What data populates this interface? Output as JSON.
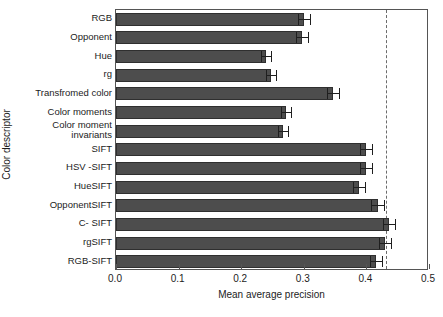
{
  "chart_data": {
    "type": "bar",
    "orientation": "horizontal",
    "title": "",
    "xlabel": "Mean average precision",
    "ylabel": "Color descriptor",
    "xlim": [
      0.0,
      0.5
    ],
    "xticks": [
      "0.0",
      "0.1",
      "0.2",
      "0.3",
      "0.4",
      "0.5"
    ],
    "xtick_values": [
      0.0,
      0.1,
      0.2,
      0.3,
      0.4,
      0.5
    ],
    "grid": false,
    "legend": "none",
    "bar_color": "#4d4d4d",
    "bar_edge_color": "#2f2f2f",
    "reference_line": {
      "value": 0.431,
      "style": "dashed",
      "color": "#6b6b6b"
    },
    "categories": [
      "RGB",
      "Opponent",
      "Hue",
      "rg",
      "Transfromed color",
      "Color moments",
      "Color moment\ninvariants",
      "SIFT",
      "HSV -SIFT",
      "HueSIFT",
      "OpponentSIFT",
      "C- SIFT",
      "rgSIFT",
      "RGB-SIFT"
    ],
    "values": [
      0.3,
      0.297,
      0.24,
      0.248,
      0.347,
      0.272,
      0.267,
      0.399,
      0.399,
      0.388,
      0.418,
      0.436,
      0.43,
      0.415
    ],
    "errors": [
      0.01,
      0.01,
      0.008,
      0.008,
      0.01,
      0.008,
      0.008,
      0.01,
      0.01,
      0.01,
      0.01,
      0.01,
      0.01,
      0.01
    ]
  },
  "caption": {
    "text": "partially cropped caption line"
  }
}
